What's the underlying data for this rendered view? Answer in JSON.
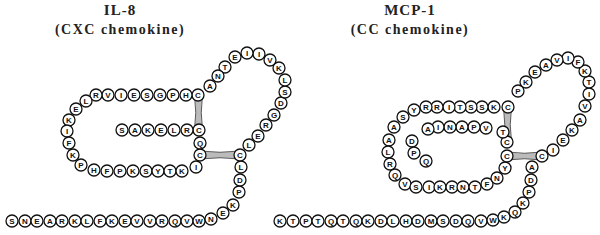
{
  "panels": [
    {
      "title": "IL-8",
      "subtitle": "(CXC chemokine)",
      "bead_radius": 6,
      "beads": [
        [
          "S",
          12,
          221
        ],
        [
          "N",
          25,
          221
        ],
        [
          "E",
          37,
          221
        ],
        [
          "A",
          50,
          221
        ],
        [
          "R",
          62,
          221
        ],
        [
          "K",
          75,
          221
        ],
        [
          "L",
          87,
          221
        ],
        [
          "F",
          100,
          221
        ],
        [
          "K",
          112,
          221
        ],
        [
          "E",
          125,
          221
        ],
        [
          "V",
          137,
          221
        ],
        [
          "V",
          150,
          221
        ],
        [
          "R",
          162,
          221
        ],
        [
          "Q",
          175,
          221
        ],
        [
          "V",
          187,
          221
        ],
        [
          "W",
          199,
          221
        ],
        [
          "N",
          211,
          219
        ],
        [
          "E",
          223,
          213
        ],
        [
          "K",
          233,
          205
        ],
        [
          "P",
          239,
          192
        ],
        [
          "D",
          240,
          180
        ],
        [
          "L",
          241,
          167
        ],
        [
          "C",
          240,
          155
        ],
        [
          "L",
          249,
          145
        ],
        [
          "E",
          258,
          136
        ],
        [
          "R",
          266,
          125
        ],
        [
          "G",
          274,
          115
        ],
        [
          "D",
          281,
          103
        ],
        [
          "S",
          285,
          92
        ],
        [
          "L",
          285,
          80
        ],
        [
          "K",
          279,
          68
        ],
        [
          "V",
          270,
          60
        ],
        [
          "I",
          259,
          54
        ],
        [
          "I",
          247,
          53
        ],
        [
          "E",
          235,
          57
        ],
        [
          "T",
          225,
          67
        ],
        [
          "N",
          218,
          76
        ],
        [
          "A",
          210,
          86
        ],
        [
          "C",
          198,
          95
        ],
        [
          "H",
          186,
          95
        ],
        [
          "P",
          173,
          95
        ],
        [
          "G",
          160,
          95
        ],
        [
          "S",
          147,
          95
        ],
        [
          "E",
          134,
          95
        ],
        [
          "I",
          121,
          95
        ],
        [
          "V",
          108,
          95
        ],
        [
          "R",
          96,
          95
        ],
        [
          "L",
          86,
          101
        ],
        [
          "E",
          76,
          109
        ],
        [
          "K",
          69,
          120
        ],
        [
          "I",
          67,
          131
        ],
        [
          "F",
          69,
          143
        ],
        [
          "K",
          73,
          155
        ],
        [
          "P",
          81,
          165
        ],
        [
          "H",
          94,
          170
        ],
        [
          "F",
          107,
          171
        ],
        [
          "P",
          120,
          171
        ],
        [
          "K",
          133,
          171
        ],
        [
          "S",
          146,
          171
        ],
        [
          "Y",
          158,
          171
        ],
        [
          "T",
          170,
          171
        ],
        [
          "K",
          182,
          171
        ],
        [
          "I",
          196,
          167
        ],
        [
          "C",
          200,
          155
        ],
        [
          "Q",
          200,
          143
        ],
        [
          "C",
          199,
          130
        ],
        [
          "R",
          187,
          130
        ],
        [
          "L",
          174,
          130
        ],
        [
          "E",
          161,
          130
        ],
        [
          "K",
          148,
          130
        ],
        [
          "A",
          135,
          130
        ],
        [
          "S",
          122,
          130
        ]
      ],
      "disulfide_bridges": [
        [
          198,
          95,
          199,
          130
        ],
        [
          200,
          155,
          240,
          155
        ]
      ]
    },
    {
      "title": "MCP-1",
      "subtitle": "(CC chemokine)",
      "bead_radius": 6,
      "beads": [
        [
          "K",
          280,
          221
        ],
        [
          "T",
          293,
          221
        ],
        [
          "P",
          306,
          221
        ],
        [
          "T",
          318,
          221
        ],
        [
          "Q",
          331,
          221
        ],
        [
          "T",
          343,
          221
        ],
        [
          "Q",
          356,
          221
        ],
        [
          "K",
          368,
          221
        ],
        [
          "D",
          381,
          221
        ],
        [
          "L",
          393,
          221
        ],
        [
          "H",
          406,
          221
        ],
        [
          "D",
          418,
          221
        ],
        [
          "M",
          431,
          221
        ],
        [
          "S",
          443,
          221
        ],
        [
          "D",
          456,
          221
        ],
        [
          "Q",
          468,
          221
        ],
        [
          "V",
          481,
          221
        ],
        [
          "W",
          493,
          220
        ],
        [
          "K",
          504,
          217
        ],
        [
          "Q",
          515,
          212
        ],
        [
          "K",
          523,
          203
        ],
        [
          "P",
          529,
          192
        ],
        [
          "D",
          531,
          180
        ],
        [
          "A",
          532,
          167
        ],
        [
          "C",
          542,
          156
        ],
        [
          "I",
          553,
          150
        ],
        [
          "E",
          563,
          140
        ],
        [
          "K",
          572,
          130
        ],
        [
          "A",
          580,
          120
        ],
        [
          "V",
          585,
          106
        ],
        [
          "I",
          589,
          94
        ],
        [
          "T",
          589,
          82
        ],
        [
          "K",
          585,
          71
        ],
        [
          "F",
          578,
          62
        ],
        [
          "I",
          568,
          58
        ],
        [
          "V",
          557,
          60
        ],
        [
          "A",
          546,
          65
        ],
        [
          "E",
          535,
          72
        ],
        [
          "K",
          526,
          82
        ],
        [
          "P",
          518,
          91
        ],
        [
          "C",
          508,
          107
        ],
        [
          "K",
          494,
          107
        ],
        [
          "S",
          482,
          107
        ],
        [
          "S",
          471,
          107
        ],
        [
          "T",
          460,
          107
        ],
        [
          "I",
          449,
          107
        ],
        [
          "R",
          437,
          107
        ],
        [
          "R",
          426,
          107
        ],
        [
          "Y",
          414,
          110
        ],
        [
          "S",
          403,
          117
        ],
        [
          "A",
          394,
          127
        ],
        [
          "A",
          389,
          140
        ],
        [
          "L",
          388,
          152
        ],
        [
          "R",
          390,
          164
        ],
        [
          "Q",
          395,
          175
        ],
        [
          "V",
          405,
          184
        ],
        [
          "S",
          416,
          187
        ],
        [
          "I",
          429,
          187
        ],
        [
          "K",
          440,
          187
        ],
        [
          "R",
          452,
          187
        ],
        [
          "N",
          463,
          187
        ],
        [
          "T",
          475,
          187
        ],
        [
          "F",
          487,
          184
        ],
        [
          "N",
          497,
          178
        ],
        [
          "Y",
          505,
          168
        ],
        [
          "C",
          507,
          156
        ],
        [
          "C",
          507,
          142
        ],
        [
          "T",
          503,
          132
        ],
        [
          "V",
          486,
          128
        ],
        [
          "P",
          474,
          127
        ],
        [
          "A",
          462,
          127
        ],
        [
          "N",
          450,
          127
        ],
        [
          "I",
          438,
          127
        ],
        [
          "A",
          428,
          129
        ],
        [
          "D",
          412,
          141
        ],
        [
          "P",
          414,
          153
        ],
        [
          "Q",
          426,
          161
        ]
      ],
      "disulfide_bridges": [
        [
          508,
          107,
          507,
          142
        ],
        [
          507,
          156,
          542,
          156
        ]
      ]
    }
  ]
}
